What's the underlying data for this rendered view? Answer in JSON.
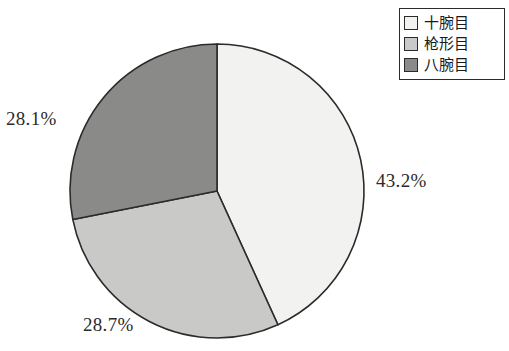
{
  "chart_data": {
    "type": "pie",
    "title": "",
    "subtitle": "",
    "xlabel": "",
    "ylabel": "",
    "legend_position": "top-right",
    "grid": false,
    "start_angle_deg": 0,
    "direction": "clockwise",
    "categories": [
      "十腕目",
      "枪形目",
      "八腕目"
    ],
    "values": [
      43.2,
      28.7,
      28.1
    ],
    "data_labels": [
      "43.2%",
      "28.7%",
      "28.1%"
    ],
    "colors": [
      "#f2f2f0",
      "#c9c9c7",
      "#8a8a88"
    ],
    "edge_color": "#2b2b2b",
    "slices": [
      {
        "label": "十腕目",
        "value": 43.2,
        "data_label": "43.2%",
        "color": "#f2f2f0"
      },
      {
        "label": "枪形目",
        "value": 28.7,
        "data_label": "28.7%",
        "color": "#c9c9c7"
      },
      {
        "label": "八腕目",
        "value": 28.1,
        "data_label": "28.1%",
        "color": "#8a8a88"
      }
    ]
  },
  "legend": {
    "items": [
      {
        "label": "十腕目",
        "color": "#f2f2f0"
      },
      {
        "label": "枪形目",
        "color": "#c9c9c7"
      },
      {
        "label": "八腕目",
        "color": "#8a8a88"
      }
    ]
  },
  "labels": {
    "slice_0": "43.2%",
    "slice_1": "28.7%",
    "slice_2": "28.1%"
  }
}
